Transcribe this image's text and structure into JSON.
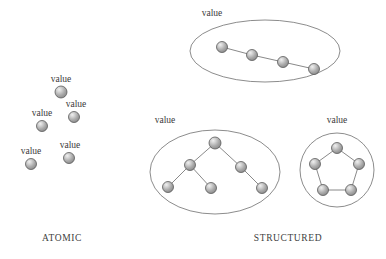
{
  "figure": {
    "background_color": "#ffffff",
    "node_fill_light": "#e2e2e2",
    "node_fill_mid": "#a8a8a8",
    "node_fill_dark": "#7c7c7c",
    "node_stroke": "#5a5a5a",
    "edge_color": "#6b6b6b",
    "enclosure_stroke": "#6e6e6e",
    "text_color": "#3a3a3a"
  },
  "captions": {
    "atomic": "ATOMIC",
    "structured": "STRUCTURED"
  },
  "labels": {
    "value": "value"
  },
  "chart_data": {
    "type": "diagram",
    "groups": [
      {
        "name": "atomic",
        "caption": "ATOMIC",
        "caption_position": {
          "x": 62,
          "y": 241
        },
        "enclosure": null,
        "nodes": [
          {
            "id": "a1",
            "label": "value",
            "x": 61,
            "y": 92,
            "r": 6.0,
            "label_x": 61,
            "label_y": 82
          },
          {
            "id": "a2",
            "label": "value",
            "x": 42,
            "y": 126,
            "r": 5.5,
            "label_x": 42,
            "label_y": 116
          },
          {
            "id": "a3",
            "label": "value",
            "x": 74,
            "y": 117,
            "r": 5.5,
            "label_x": 76,
            "label_y": 107
          },
          {
            "id": "a4",
            "label": "value",
            "x": 31,
            "y": 164,
            "r": 5.5,
            "label_x": 31,
            "label_y": 154
          },
          {
            "id": "a5",
            "label": "value",
            "x": 69,
            "y": 158,
            "r": 5.5,
            "label_x": 70,
            "label_y": 148
          }
        ],
        "edges": []
      },
      {
        "name": "structured-chain",
        "caption": null,
        "label": "value",
        "label_position": {
          "x": 212,
          "y": 16
        },
        "enclosure": {
          "shape": "ellipse",
          "cx": 265,
          "cy": 51,
          "rx": 75,
          "ry": 31
        },
        "nodes": [
          {
            "id": "c1",
            "x": 222,
            "y": 47,
            "r": 5.5
          },
          {
            "id": "c2",
            "x": 252,
            "y": 55,
            "r": 5.5
          },
          {
            "id": "c3",
            "x": 283,
            "y": 62,
            "r": 5.5
          },
          {
            "id": "c4",
            "x": 314,
            "y": 69,
            "r": 5.5
          }
        ],
        "edges": [
          [
            "c1",
            "c2"
          ],
          [
            "c2",
            "c3"
          ],
          [
            "c3",
            "c4"
          ]
        ]
      },
      {
        "name": "structured-tree",
        "caption": null,
        "label": "value",
        "label_position": {
          "x": 165,
          "y": 123
        },
        "enclosure": {
          "shape": "ellipse",
          "cx": 215,
          "cy": 172,
          "rx": 65,
          "ry": 42
        },
        "nodes": [
          {
            "id": "t1",
            "x": 215,
            "y": 143,
            "r": 6.0
          },
          {
            "id": "t2",
            "x": 190,
            "y": 165,
            "r": 5.5
          },
          {
            "id": "t3",
            "x": 241,
            "y": 167,
            "r": 5.5
          },
          {
            "id": "t4",
            "x": 168,
            "y": 187,
            "r": 5.5
          },
          {
            "id": "t5",
            "x": 211,
            "y": 188,
            "r": 5.5
          },
          {
            "id": "t6",
            "x": 262,
            "y": 188,
            "r": 5.5
          }
        ],
        "edges": [
          [
            "t1",
            "t2"
          ],
          [
            "t1",
            "t3"
          ],
          [
            "t2",
            "t4"
          ],
          [
            "t2",
            "t5"
          ],
          [
            "t3",
            "t6"
          ]
        ]
      },
      {
        "name": "structured-ring",
        "caption": null,
        "label": "value",
        "label_position": {
          "x": 337,
          "y": 123
        },
        "enclosure": {
          "shape": "circle",
          "cx": 337,
          "cy": 170,
          "rx": 37,
          "ry": 37
        },
        "nodes": [
          {
            "id": "r1",
            "x": 337,
            "y": 148,
            "r": 5.5
          },
          {
            "id": "r2",
            "x": 359,
            "y": 164,
            "r": 5.5
          },
          {
            "id": "r3",
            "x": 351,
            "y": 190,
            "r": 5.5
          },
          {
            "id": "r4",
            "x": 323,
            "y": 190,
            "r": 5.5
          },
          {
            "id": "r5",
            "x": 315,
            "y": 164,
            "r": 5.5
          }
        ],
        "edges": [
          [
            "r1",
            "r2"
          ],
          [
            "r2",
            "r3"
          ],
          [
            "r3",
            "r4"
          ],
          [
            "r4",
            "r5"
          ],
          [
            "r5",
            "r1"
          ]
        ]
      }
    ],
    "structured_caption_position": {
      "x": 288,
      "y": 241
    }
  }
}
